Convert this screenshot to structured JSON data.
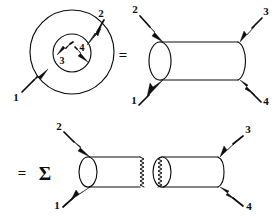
{
  "figure": {
    "caption": "",
    "background_color": "#ffffff",
    "ink_color": "#0d0d0d",
    "width": 277,
    "height": 216
  },
  "operators": {
    "equals_top": "=",
    "equals_bottom": "=",
    "sum_symbol": "Σ"
  },
  "diagrams": [
    {
      "id": "annulus",
      "name": "annulus-four-point",
      "shape": "annulus",
      "row": "top",
      "position": "left",
      "outer_radius": 44,
      "inner_radius": 19,
      "external_legs": [
        {
          "label": "2",
          "direction": "outgoing",
          "corner": "top-right"
        },
        {
          "label": "1",
          "direction": "incoming",
          "corner": "bottom-left"
        }
      ],
      "internal_legs": [
        {
          "label": "3",
          "direction": "incoming",
          "corner": "inner-left"
        },
        {
          "label": "4",
          "direction": "incoming",
          "corner": "inner-right"
        }
      ]
    },
    {
      "id": "cylinder-whole",
      "name": "cylinder-four-point",
      "shape": "cylinder",
      "row": "top",
      "position": "right",
      "cut": false,
      "external_legs": [
        {
          "label": "2",
          "direction": "incoming",
          "corner": "top-left"
        },
        {
          "label": "3",
          "direction": "outgoing",
          "corner": "top-right"
        },
        {
          "label": "1",
          "direction": "incoming",
          "corner": "bottom-left"
        },
        {
          "label": "4",
          "direction": "outgoing",
          "corner": "bottom-right"
        }
      ]
    },
    {
      "id": "cylinder-cut-left",
      "name": "cut-cylinder-left",
      "shape": "cylinder",
      "row": "bottom",
      "position": "left",
      "cut": true,
      "cut_edge": "right",
      "external_legs": [
        {
          "label": "2",
          "direction": "incoming",
          "corner": "top-left"
        },
        {
          "label": "1",
          "direction": "incoming",
          "corner": "bottom-left"
        }
      ]
    },
    {
      "id": "cylinder-cut-right",
      "name": "cut-cylinder-right",
      "shape": "cylinder",
      "row": "bottom",
      "position": "right",
      "cut": true,
      "cut_edge": "left",
      "external_legs": [
        {
          "label": "3",
          "direction": "outgoing",
          "corner": "top-right"
        },
        {
          "label": "4",
          "direction": "outgoing",
          "corner": "bottom-right"
        }
      ]
    }
  ],
  "labels": {
    "annulus_leg_2": "2",
    "annulus_leg_1": "1",
    "annulus_inner_3": "3",
    "annulus_inner_4": "4",
    "cyl_top_leg_2": "2",
    "cyl_top_leg_3": "3",
    "cyl_top_leg_1": "1",
    "cyl_top_leg_4": "4",
    "cyl_bot_leg_2": "2",
    "cyl_bot_leg_3": "3",
    "cyl_bot_leg_1": "1",
    "cyl_bot_leg_4": "4"
  }
}
